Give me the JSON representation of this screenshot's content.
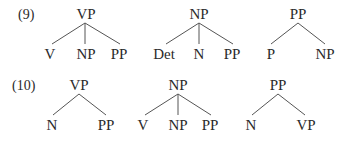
{
  "examples": [
    {
      "number": "(9)",
      "trees": [
        {
          "root": "VP",
          "children": [
            "V",
            "NP",
            "PP"
          ]
        },
        {
          "root": "NP",
          "children": [
            "Det",
            "N",
            "PP"
          ]
        },
        {
          "root": "PP",
          "children": [
            "P",
            "NP"
          ]
        }
      ]
    },
    {
      "number": "(10)",
      "trees": [
        {
          "root": "VP",
          "children": [
            "N",
            "PP"
          ]
        },
        {
          "root": "NP",
          "children": [
            "V",
            "NP",
            "PP"
          ]
        },
        {
          "root": "PP",
          "children": [
            "N",
            "VP"
          ]
        }
      ]
    }
  ]
}
